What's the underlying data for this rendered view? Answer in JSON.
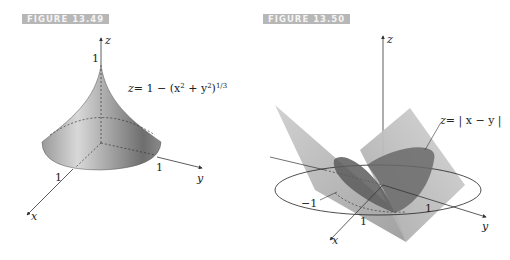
{
  "figures": [
    {
      "label": "FIGURE 13.49",
      "equation": "z = 1 − (x² + y²)^{1/3}",
      "equation_parts": {
        "lhs": "z",
        "rhs_main": "= 1 − (x",
        "sup1": "2",
        "mid": " + y",
        "sup2": "2",
        "close": ")",
        "sup3": "1/3"
      },
      "axes": {
        "x": "x",
        "y": "y",
        "z": "z"
      },
      "ticks": {
        "z_top": "1",
        "x": "1",
        "y": "1"
      }
    },
    {
      "label": "FIGURE 13.50",
      "equation": "z = | x − y |",
      "equation_parts": {
        "lhs": "z",
        "rhs": "= | x − y |"
      },
      "axes": {
        "x": "x",
        "y": "y",
        "z": "z"
      },
      "ticks": {
        "neg": "−1",
        "x": "1",
        "y": "1"
      }
    }
  ]
}
